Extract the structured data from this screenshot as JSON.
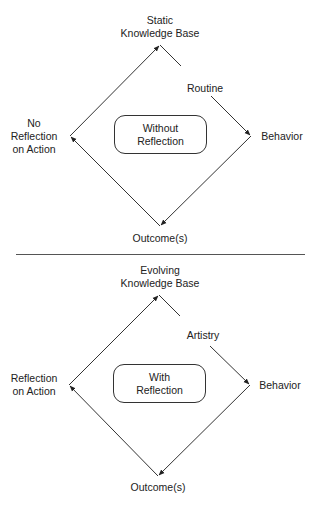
{
  "panels": [
    {
      "id": "without",
      "top_label": [
        "Static",
        "Knowledge Base"
      ],
      "edge_label": "Routine",
      "right_label": "Behavior",
      "left_label": [
        "No",
        "Reflection",
        "on Action"
      ],
      "bottom_label": "Outcome(s)",
      "center_box": [
        "Without",
        "Reflection"
      ]
    },
    {
      "id": "with",
      "top_label": [
        "Evolving",
        "Knowledge Base"
      ],
      "edge_label": "Artistry",
      "right_label": "Behavior",
      "left_label": [
        "Reflection",
        "on Action"
      ],
      "bottom_label": "Outcome(s)",
      "center_box": [
        "With",
        "Reflection"
      ]
    }
  ],
  "colors": {
    "line": "#333333",
    "text": "#222222",
    "divider": "#555555"
  }
}
